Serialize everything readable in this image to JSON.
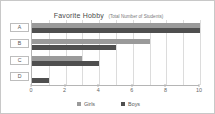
{
  "chart_data": {
    "type": "bar",
    "orientation": "horizontal",
    "title": "Favorite Hobby",
    "subtitle": "(Total Number of Students)",
    "categories": [
      "A",
      "B",
      "C",
      "D"
    ],
    "series": [
      {
        "name": "Girls",
        "color": "#9a9a9a",
        "values": [
          10,
          7,
          3,
          0
        ]
      },
      {
        "name": "Boys",
        "color": "#4f4f4f",
        "values": [
          10,
          5,
          4,
          1
        ]
      }
    ],
    "xlabel": "",
    "ylabel": "",
    "xlim": [
      0,
      10
    ],
    "xticks": [
      0,
      2,
      4,
      6,
      8,
      10
    ],
    "xtick_labels": [
      "0",
      "2",
      "4",
      "6",
      "8",
      "10"
    ],
    "gridlines": [
      1,
      2,
      3,
      4,
      5,
      6,
      7,
      8,
      9,
      10
    ],
    "grid": true,
    "legend_position": "bottom"
  },
  "legend": {
    "items": [
      {
        "label": "Girls",
        "swatch": "girls-swatch"
      },
      {
        "label": "Boys",
        "swatch": "boys-swatch"
      }
    ]
  }
}
